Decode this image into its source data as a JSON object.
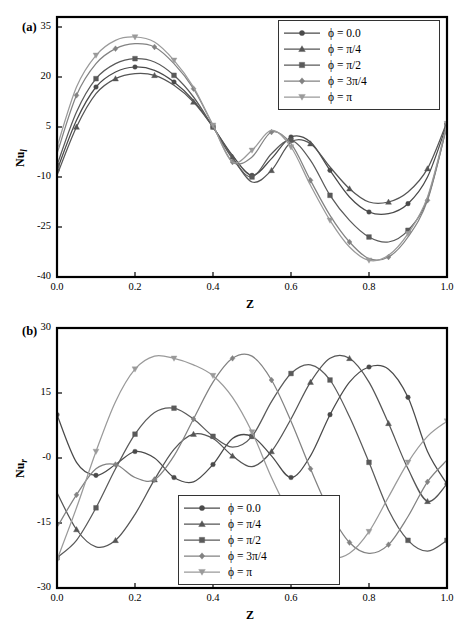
{
  "figure": {
    "panels": [
      {
        "tag": "(a)",
        "xlabel": "Z",
        "ylabel": "Nu",
        "ylabel_sub": "l",
        "xticks": [
          "0.0",
          "0.2",
          "0.4",
          "0.6",
          "0.8",
          "1.0"
        ],
        "yticks": [
          "35",
          "20",
          "5",
          "-10",
          "-25",
          "-40"
        ]
      },
      {
        "tag": "(b)",
        "xlabel": "Z",
        "ylabel": "Nu",
        "ylabel_sub": "r",
        "xticks": [
          "0.0",
          "0.2",
          "0.4",
          "0.6",
          "0.8",
          "1.0"
        ],
        "yticks": [
          "30",
          "15",
          "-0",
          "-15",
          "-30"
        ]
      }
    ],
    "legend": {
      "entries": [
        {
          "label": "ϕ = 0.0",
          "marker": "circle",
          "color": "#4a4a4a"
        },
        {
          "label": "ϕ = π/4",
          "marker": "triangle-up",
          "color": "#555555"
        },
        {
          "label": "ϕ = π/2",
          "marker": "square",
          "color": "#5a5a5a"
        },
        {
          "label": "ϕ = 3π/4",
          "marker": "diamond",
          "color": "#828282"
        },
        {
          "label": "ϕ = π",
          "marker": "triangle-down",
          "color": "#9a9a9a"
        }
      ]
    }
  },
  "chart_data": [
    {
      "type": "line",
      "title": "(a)",
      "xlabel": "Z",
      "ylabel": "Nu_l",
      "xlim": [
        0.0,
        1.0
      ],
      "ylim": [
        -40,
        38
      ],
      "xticks": [
        0.0,
        0.2,
        0.4,
        0.6,
        0.8,
        1.0
      ],
      "yticks": [
        35,
        20,
        5,
        -10,
        -25,
        -40
      ],
      "grid": false,
      "legend_position": "top-right",
      "x": [
        0.0,
        0.05,
        0.1,
        0.15,
        0.2,
        0.25,
        0.3,
        0.35,
        0.4,
        0.45,
        0.5,
        0.55,
        0.6,
        0.65,
        0.7,
        0.75,
        0.8,
        0.85,
        0.9,
        0.95,
        1.0
      ],
      "series": [
        {
          "name": "ϕ = 0.0",
          "marker": "circle",
          "color": "#4a4a4a",
          "values": [
            -8.0,
            7.0,
            17.0,
            21.5,
            23.0,
            22.0,
            18.5,
            13.0,
            5.0,
            -3.5,
            -9.5,
            -4.5,
            2.0,
            0.5,
            -8.0,
            -16.0,
            -20.5,
            -21.0,
            -18.0,
            -10.0,
            6.0
          ]
        },
        {
          "name": "ϕ = π/4",
          "marker": "triangle-up",
          "color": "#555555",
          "values": [
            -9.5,
            5.0,
            15.0,
            19.5,
            21.0,
            20.5,
            17.5,
            12.5,
            5.0,
            -4.0,
            -11.5,
            -8.0,
            0.5,
            0.0,
            -7.0,
            -13.5,
            -17.5,
            -17.5,
            -14.5,
            -7.5,
            6.5
          ]
        },
        {
          "name": "ϕ = π/2",
          "marker": "square",
          "color": "#5a5a5a",
          "values": [
            -6.5,
            9.5,
            19.5,
            24.0,
            25.5,
            24.5,
            20.5,
            14.0,
            5.0,
            -4.5,
            -10.0,
            -3.0,
            1.0,
            -5.0,
            -15.5,
            -23.0,
            -28.0,
            -29.5,
            -26.0,
            -16.5,
            5.5
          ]
        },
        {
          "name": "ϕ = 3π/4",
          "marker": "diamond",
          "color": "#828282",
          "values": [
            -3.0,
            14.5,
            24.0,
            28.5,
            30.0,
            29.0,
            24.0,
            16.5,
            5.5,
            -5.5,
            -4.0,
            3.5,
            0.0,
            -11.0,
            -21.5,
            -29.5,
            -34.5,
            -34.0,
            -28.0,
            -17.0,
            5.5
          ]
        },
        {
          "name": "ϕ = π",
          "marker": "triangle-down",
          "color": "#9a9a9a",
          "values": [
            -1.0,
            17.0,
            26.5,
            31.0,
            32.0,
            30.5,
            25.0,
            17.0,
            5.5,
            -5.5,
            -2.0,
            4.0,
            -1.0,
            -12.5,
            -23.0,
            -31.0,
            -35.0,
            -33.5,
            -27.0,
            -16.0,
            6.0
          ]
        }
      ]
    },
    {
      "type": "line",
      "title": "(b)",
      "xlabel": "Z",
      "ylabel": "Nu_r",
      "xlim": [
        0.0,
        1.0
      ],
      "ylim": [
        -30,
        30
      ],
      "xticks": [
        0.0,
        0.2,
        0.4,
        0.6,
        0.8,
        1.0
      ],
      "yticks": [
        30,
        15,
        0,
        -15,
        -30
      ],
      "grid": false,
      "legend_position": "bottom-center",
      "x": [
        0.0,
        0.05,
        0.1,
        0.15,
        0.2,
        0.25,
        0.3,
        0.35,
        0.4,
        0.45,
        0.5,
        0.55,
        0.6,
        0.65,
        0.7,
        0.75,
        0.8,
        0.85,
        0.9,
        0.95,
        1.0
      ],
      "series": [
        {
          "name": "ϕ = 0.0",
          "marker": "circle",
          "color": "#4a4a4a",
          "values": [
            10.0,
            -1.0,
            -4.0,
            -1.5,
            1.5,
            0.0,
            -4.5,
            -5.5,
            -1.5,
            4.5,
            5.0,
            0.5,
            -4.5,
            0.5,
            10.0,
            17.5,
            21.0,
            20.5,
            14.0,
            1.5,
            -6.0
          ]
        },
        {
          "name": "ϕ = π/4",
          "marker": "triangle-up",
          "color": "#555555",
          "values": [
            -8.0,
            -16.5,
            -20.5,
            -19.0,
            -13.0,
            -5.0,
            2.0,
            5.5,
            4.5,
            0.5,
            -2.0,
            1.5,
            9.0,
            17.5,
            23.0,
            23.0,
            17.5,
            8.0,
            -2.5,
            -10.0,
            -6.0
          ]
        },
        {
          "name": "ϕ = π/2",
          "marker": "square",
          "color": "#5a5a5a",
          "values": [
            -23.0,
            -19.0,
            -11.5,
            -2.5,
            5.5,
            10.5,
            11.5,
            9.0,
            5.0,
            2.5,
            5.0,
            13.0,
            19.5,
            21.5,
            18.0,
            9.5,
            -1.0,
            -12.0,
            -19.0,
            -21.5,
            -19.0
          ]
        },
        {
          "name": "ϕ = 3π/4",
          "marker": "diamond",
          "color": "#828282",
          "values": [
            -16.0,
            -8.5,
            -2.5,
            -1.5,
            -4.5,
            -5.0,
            0.5,
            9.0,
            17.5,
            23.0,
            23.5,
            18.0,
            8.5,
            -2.5,
            -12.5,
            -19.5,
            -22.0,
            -20.0,
            -13.5,
            -5.5,
            -0.5
          ]
        },
        {
          "name": "ϕ = π",
          "marker": "triangle-down",
          "color": "#9a9a9a",
          "values": [
            -23.5,
            -11.5,
            1.5,
            13.0,
            20.5,
            23.5,
            23.0,
            21.5,
            19.0,
            14.0,
            6.0,
            -4.5,
            -13.5,
            -20.0,
            -23.0,
            -22.0,
            -17.0,
            -9.0,
            -1.0,
            5.0,
            8.5
          ]
        }
      ]
    }
  ]
}
